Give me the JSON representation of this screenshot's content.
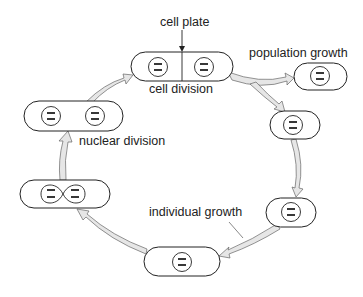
{
  "diagram": {
    "colors": {
      "outline": "#222222",
      "arrow_fill": "#e6e6e6",
      "arrow_stroke": "#666666",
      "text": "#222222",
      "background": "#ffffff"
    },
    "labels": {
      "cell_plate": "cell plate",
      "cell_division": "cell division",
      "population_growth": "population growth",
      "nuclear_division": "nuclear division",
      "individual_growth": "individual growth"
    },
    "stages": [
      {
        "id": "cell-division",
        "label": "cell division",
        "nuclei": 2,
        "has_cell_plate": true
      },
      {
        "id": "daughter-cell-population",
        "label": "population growth",
        "nuclei": 1
      },
      {
        "id": "daughter-cell-cycle",
        "nuclei": 1
      },
      {
        "id": "growing-cell-small",
        "nuclei": 1
      },
      {
        "id": "growing-cell-large",
        "label": "individual growth",
        "nuclei": 1
      },
      {
        "id": "dividing-nucleus",
        "nuclei": 1,
        "state": "dividing"
      },
      {
        "id": "two-nuclei-cell",
        "label": "nuclear division",
        "nuclei": 2
      }
    ]
  }
}
